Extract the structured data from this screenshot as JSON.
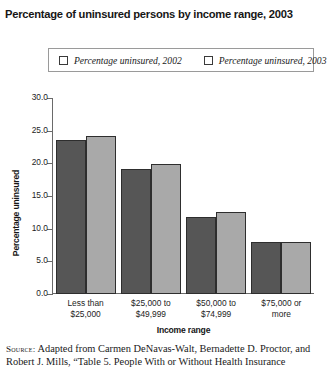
{
  "title": "Percentage of uninsured persons by income range, 2003",
  "legend": {
    "items": [
      {
        "label": "Percentage uninsured, 2002",
        "color": "#565656"
      },
      {
        "label": "Percentage uninsured, 2003",
        "color": "#a9a9a9"
      }
    ]
  },
  "axes": {
    "ylabel": "Percentage uninsured",
    "xlabel": "Income range",
    "yticks": [
      "0.0",
      "5.0",
      "10.0",
      "15.0",
      "20.0",
      "25.0",
      "30.0"
    ]
  },
  "source": {
    "keyword": "Source:",
    "text": " Adapted from Carmen DeNavas-Walt, Bernadette D. Proctor, and Robert J. Mills, “Table 5. People With or Without Health Insurance"
  },
  "chart_data": {
    "type": "bar",
    "title": "Percentage of uninsured persons by income range, 2003",
    "xlabel": "Income range",
    "ylabel": "Percentage uninsured",
    "ylim": [
      0,
      30
    ],
    "ytick_step": 5,
    "grid": false,
    "legend_position": "top",
    "categories": [
      "Less than $25,000",
      "$25,000 to $49,999",
      "$50,000 to $74,999",
      "$75,000 or more"
    ],
    "category_lines": [
      [
        "Less than",
        "$25,000"
      ],
      [
        "$25,000 to",
        "$49,999"
      ],
      [
        "$50,000 to",
        "$74,999"
      ],
      [
        "$75,000 or",
        "more"
      ]
    ],
    "series": [
      {
        "name": "Percentage uninsured, 2002",
        "color": "#565656",
        "values": [
          23.6,
          19.2,
          11.8,
          8.0
        ]
      },
      {
        "name": "Percentage uninsured, 2003",
        "color": "#a9a9a9",
        "values": [
          24.2,
          19.9,
          12.5,
          8.0
        ]
      }
    ]
  }
}
